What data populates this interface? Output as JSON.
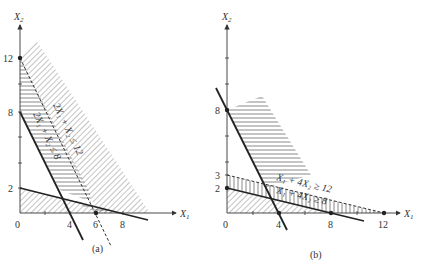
{
  "panels": [
    {
      "id": "a",
      "caption": "(a)",
      "x_axis_label": "X",
      "x_axis_sub": "1",
      "y_axis_label": "X",
      "y_axis_sub": "2",
      "x_ticks": [
        "0",
        "4",
        "6",
        "8"
      ],
      "y_ticks": [
        "2",
        "8",
        "12"
      ],
      "constraints": [
        {
          "text": "2X₁ + X₂ ≤ 12"
        },
        {
          "text": "2X₁ + X₂ ≤ 8"
        }
      ]
    },
    {
      "id": "b",
      "caption": "(b)",
      "x_axis_label": "X",
      "x_axis_sub": "1",
      "y_axis_label": "X",
      "y_axis_sub": "2",
      "x_ticks": [
        "0",
        "4",
        "8",
        "12"
      ],
      "y_ticks": [
        "2",
        "3",
        "8"
      ],
      "constraints": [
        {
          "text": "X₁ + 4X₂ ≥ 12"
        },
        {
          "text": "X₁ + 4X₂ ≥ 8"
        }
      ]
    }
  ],
  "colors": {
    "ink": "#222222",
    "hatch": "#555555",
    "background": "#ffffff"
  }
}
